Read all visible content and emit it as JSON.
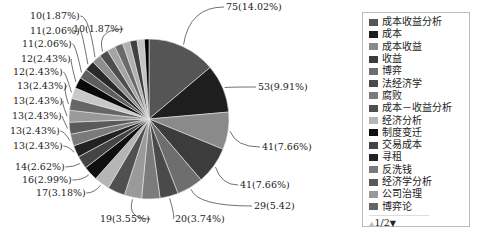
{
  "chart_data": {
    "type": "pie",
    "title": "",
    "total": 535,
    "slices": [
      {
        "value": 75,
        "pct": "14.02%",
        "label": "75(14.02%)",
        "color": "#555555"
      },
      {
        "value": 53,
        "pct": "9.91%",
        "label": "53(9.91%)",
        "color": "#1e1e1e"
      },
      {
        "value": 41,
        "pct": "7.66%",
        "label": "41(7.66%)",
        "color": "#8a8a8a"
      },
      {
        "value": 41,
        "pct": "7.66%",
        "label": "41(7.66%)",
        "color": "#3c3c3c"
      },
      {
        "value": 29,
        "pct": "5.42",
        "label": "29(5.42)",
        "color": "#6e6e6e"
      },
      {
        "value": 20,
        "pct": "3.74%",
        "label": "20(3.74%)",
        "color": "#4a4a4a"
      },
      {
        "value": 20,
        "pct": "3.74%",
        "label": "",
        "color": "#7b7b7b"
      },
      {
        "value": 19,
        "pct": "3.55%",
        "label": "19(3.55%)",
        "color": "#9a9a9a"
      },
      {
        "value": 19,
        "pct": "3.55%",
        "label": "",
        "color": "#505050"
      },
      {
        "value": 17,
        "pct": "3.18%",
        "label": "17(3.18%)",
        "color": "#b5b5b5"
      },
      {
        "value": 16,
        "pct": "2.99%",
        "label": "16(2.99%)",
        "color": "#0f0f0f"
      },
      {
        "value": 14,
        "pct": "2.62%",
        "label": "14(2.62%)",
        "color": "#444444"
      },
      {
        "value": 13,
        "pct": "2.43%",
        "label": "13(2.43%)",
        "color": "#222222"
      },
      {
        "value": 13,
        "pct": "2.43%",
        "label": "13(2.43%)",
        "color": "#7a7a7a"
      },
      {
        "value": 13,
        "pct": "2.43%",
        "label": "13(2.43%)",
        "color": "#5a5a5a"
      },
      {
        "value": 13,
        "pct": "2.43%",
        "label": "13(2.43%)",
        "color": "#999999"
      },
      {
        "value": 13,
        "pct": "2.43%",
        "label": "13(2.43%)",
        "color": "#666666"
      },
      {
        "value": 12,
        "pct": "2.43%",
        "label": "12(2.43%)",
        "color": "#c8c8c8"
      },
      {
        "value": 12,
        "pct": "2.43%",
        "label": "12(2.43%)",
        "color": "#0a0a0a"
      },
      {
        "value": 11,
        "pct": "2.06%",
        "label": "11(2.06%)",
        "color": "#5e5e5e"
      },
      {
        "value": 11,
        "pct": "2.06%",
        "label": "11(2.06%)",
        "color": "#2a2a2a"
      },
      {
        "value": 10,
        "pct": "1.87%",
        "label": "10(1.87%)",
        "color": "#8e8e8e"
      },
      {
        "value": 10,
        "pct": "1.87%",
        "label": "10(1.87%)",
        "color": "#4e4e4e"
      },
      {
        "value": 9,
        "pct": "",
        "label": "",
        "color": "#a4a4a4"
      },
      {
        "value": 9,
        "pct": "",
        "label": "",
        "color": "#6a6a6a"
      },
      {
        "value": 8,
        "pct": "",
        "label": "",
        "color": "#b0b0b0"
      },
      {
        "value": 8,
        "pct": "",
        "label": "",
        "color": "#404040"
      },
      {
        "value": 8,
        "pct": "",
        "label": "",
        "color": "#c4c4c4"
      },
      {
        "value": 5,
        "pct": "",
        "label": "",
        "color": "#000000"
      }
    ],
    "legend_position": "right"
  },
  "legend": {
    "items": [
      {
        "label": "成本收益分析",
        "color": "#555555"
      },
      {
        "label": "成本",
        "color": "#1e1e1e"
      },
      {
        "label": "成本收益",
        "color": "#8a8a8a"
      },
      {
        "label": "收益",
        "color": "#3c3c3c"
      },
      {
        "label": "博弈",
        "color": "#6e6e6e"
      },
      {
        "label": "法经济学",
        "color": "#4a4a4a"
      },
      {
        "label": "腐败",
        "color": "#7b7b7b"
      },
      {
        "label": "成本－收益分析",
        "color": "#505050"
      },
      {
        "label": "经济分析",
        "color": "#b5b5b5"
      },
      {
        "label": "制度变迁",
        "color": "#0f0f0f"
      },
      {
        "label": "交易成本",
        "color": "#444444"
      },
      {
        "label": "寻租",
        "color": "#222222"
      },
      {
        "label": "反洗钱",
        "color": "#7a7a7a"
      },
      {
        "label": "经济学分析",
        "color": "#5a5a5a"
      },
      {
        "label": "公司治理",
        "color": "#999999"
      },
      {
        "label": "博弈论",
        "color": "#666666"
      }
    ],
    "pager": {
      "up": "▲",
      "page": "1/2",
      "down": "▼"
    }
  }
}
